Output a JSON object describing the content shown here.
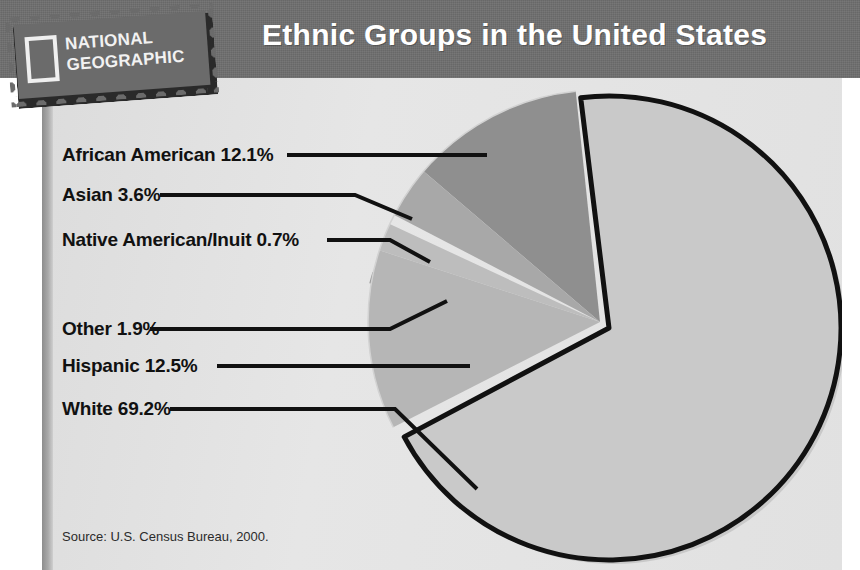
{
  "header": {
    "title": "Ethnic Groups in the United States",
    "logo": {
      "line1": "NATIONAL",
      "line2": "GEOGRAPHIC",
      "name": "national-geographic-logo"
    }
  },
  "footer": {
    "source": "Source: U.S. Census Bureau, 2000."
  },
  "colors": {
    "banner": "#6f6f6f",
    "panel": "#e3e3e3",
    "white_slice": "#c9c9c9",
    "hispanic_slice": "#b6b6b6",
    "african_american_slice": "#8f8f8f",
    "asian_slice": "#a8a8a8",
    "native_slice": "#9b9b9b",
    "other_slice": "#bdbdbd",
    "outline": "#111111",
    "label_text": "#111111"
  },
  "chart_data": {
    "type": "pie",
    "title": "Ethnic Groups in the United States",
    "source": "Source: U.S. Census Bureau, 2000.",
    "unit": "percent",
    "legend": "labels-with-leader-lines",
    "categories": [
      "White",
      "African American",
      "Hispanic",
      "Asian",
      "Other",
      "Native American/Inuit"
    ],
    "values": [
      69.2,
      12.1,
      12.5,
      3.6,
      1.9,
      0.7
    ],
    "slices": [
      {
        "name": "White",
        "value": 69.2,
        "label": "White 69.2%",
        "color": "#c9c9c9",
        "exploded": true,
        "start_deg": -7,
        "end_deg": 242
      },
      {
        "name": "Hispanic",
        "value": 12.5,
        "label": "Hispanic 12.5%",
        "color": "#b6b6b6",
        "exploded": false,
        "start_deg": 243,
        "end_deg": 288
      },
      {
        "name": "Other",
        "value": 1.9,
        "label": "Other 1.9%",
        "color": "#bdbdbd",
        "exploded": false,
        "start_deg": 288,
        "end_deg": 295
      },
      {
        "name": "Native American/Inuit",
        "value": 0.7,
        "label": "Native American/Inuit 0.7%",
        "color": "#9b9b9b",
        "exploded": false,
        "start_deg": 295,
        "end_deg": 297.5
      },
      {
        "name": "Asian",
        "value": 3.6,
        "label": "Asian 3.6%",
        "color": "#a8a8a8",
        "exploded": false,
        "start_deg": 297.5,
        "end_deg": 310.5
      },
      {
        "name": "African American",
        "value": 12.1,
        "label": "African American 12.1%",
        "color": "#8f8f8f",
        "exploded": false,
        "start_deg": 310.5,
        "end_deg": 354
      }
    ]
  },
  "labels": [
    {
      "id": "african-american",
      "text": "African American 12.1%"
    },
    {
      "id": "asian",
      "text": "Asian 3.6%"
    },
    {
      "id": "native-american",
      "text": "Native American/Inuit 0.7%"
    },
    {
      "id": "other",
      "text": "Other 1.9%"
    },
    {
      "id": "hispanic",
      "text": "Hispanic 12.5%"
    },
    {
      "id": "white",
      "text": "White 69.2%"
    }
  ]
}
